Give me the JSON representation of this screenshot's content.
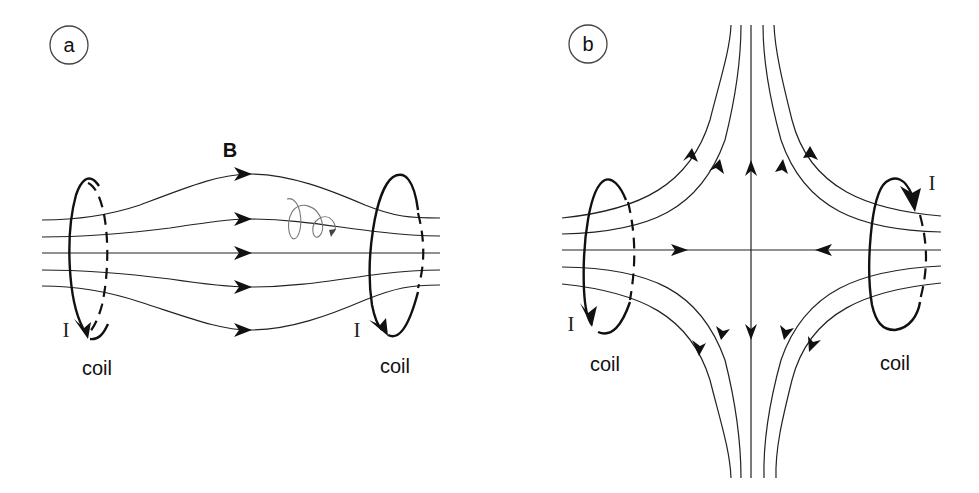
{
  "panels": [
    {
      "id": "a",
      "label": "a",
      "title": "Helmholtz coil pair (magnetic bottle)",
      "field_label": "B",
      "coil_left_label": "coil",
      "coil_right_label": "coil",
      "current_left_label": "I",
      "current_right_label": "I",
      "description": "Same-direction currents; field lines run left to right, bulging between coils; particle helix shown"
    },
    {
      "id": "b",
      "label": "b",
      "title": "Anti-Helmholtz coil pair (cusp field)",
      "coil_left_label": "coil",
      "coil_right_label": "coil",
      "current_left_label": "I",
      "current_right_label": "I",
      "description": "Opposite currents; field lines converge at center and exit vertically up and down"
    }
  ],
  "colors": {
    "line": "#222222",
    "background": "#ffffff"
  }
}
